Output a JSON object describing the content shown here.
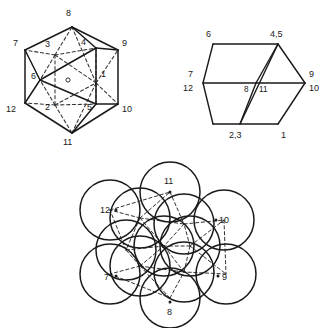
{
  "document": {
    "kind": "geometry-figure-plate",
    "background_color": "#ffffff",
    "line_color": "#1a1a1a",
    "figure_count": 3
  },
  "figures": [
    {
      "id": "icosahedron",
      "name": "icosahedral-cluster-perspective",
      "description": "Perspective view of a twelve-vertex icosahedral coordination polyhedron with solid visible edges and dashed hidden edges, centre marked by a small open circle.",
      "center_marker": "open-circle",
      "vertex_count": 12,
      "labels": [
        {
          "id": "v1",
          "text": "1",
          "x": 101,
          "y": 77
        },
        {
          "id": "v2",
          "text": "2",
          "x": 45,
          "y": 110
        },
        {
          "id": "v3",
          "text": "3",
          "x": 45,
          "y": 47
        },
        {
          "id": "v4",
          "text": "4",
          "x": 81,
          "y": 45
        },
        {
          "id": "v5",
          "text": "5",
          "x": 87,
          "y": 110
        },
        {
          "id": "v6",
          "text": "6",
          "x": 31,
          "y": 79
        },
        {
          "id": "v7",
          "text": "7",
          "x": 18,
          "y": 44
        },
        {
          "id": "v8",
          "text": "8",
          "x": 66,
          "y": 16
        },
        {
          "id": "v9",
          "text": "9",
          "x": 114,
          "y": 44
        },
        {
          "id": "v10",
          "text": "10",
          "x": 115,
          "y": 110
        },
        {
          "id": "v11",
          "text": "11",
          "x": 63,
          "y": 140
        },
        {
          "id": "v12",
          "text": "12",
          "x": 13,
          "y": 112
        }
      ]
    },
    {
      "id": "hexagon",
      "name": "hexagonal-projection-down-threefold",
      "description": "Projection of the same twelve-vertex cluster down a three-fold axis, giving a regular hexagon divided into triangles; vertices superimpose in pairs.",
      "labels": [
        {
          "id": "h6",
          "text": "6",
          "x": 28,
          "y": 24
        },
        {
          "id": "h45",
          "text": "4,5",
          "x": 92,
          "y": 24
        },
        {
          "id": "h7",
          "text": "7",
          "x": 12,
          "y": 62
        },
        {
          "id": "h12",
          "text": "12",
          "x": 8,
          "y": 75
        },
        {
          "id": "h8",
          "text": "8",
          "x": 70,
          "y": 74
        },
        {
          "id": "h11",
          "text": "11",
          "x": 84,
          "y": 74
        },
        {
          "id": "h9",
          "text": "9",
          "x": 129,
          "y": 62
        },
        {
          "id": "h10",
          "text": "10",
          "x": 127,
          "y": 75
        },
        {
          "id": "h23",
          "text": "2,3",
          "x": 55,
          "y": 124
        },
        {
          "id": "h1",
          "text": "1",
          "x": 107,
          "y": 124
        }
      ]
    },
    {
      "id": "spheres",
      "name": "closest-packed-sphere-model",
      "description": "Space filling model of the same cluster drawn as thirteen overlapping equal circles, one central sphere surrounded by twelve touching neighbours, with dashed lines joining the sphere centres.",
      "sphere_count": 13,
      "labels": [
        {
          "id": "s11",
          "text": "11",
          "x": 88,
          "y": 16
        },
        {
          "id": "s12",
          "text": "12",
          "x": 23,
          "y": 48
        },
        {
          "id": "s10",
          "text": "10",
          "x": 140,
          "y": 48
        },
        {
          "id": "s7",
          "text": "7",
          "x": 24,
          "y": 117
        },
        {
          "id": "s9",
          "text": "9",
          "x": 147,
          "y": 117
        },
        {
          "id": "s8",
          "text": "8",
          "x": 86,
          "y": 150
        }
      ]
    }
  ]
}
